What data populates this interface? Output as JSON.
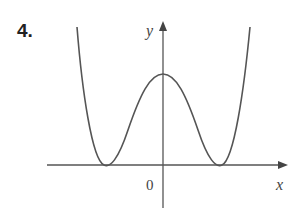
{
  "problem_number": "4.",
  "axes": {
    "x_label": "x",
    "y_label": "y",
    "origin_label": "0"
  },
  "curve": {
    "description": "even quartic-like curve with local maximum on y-axis and two minima touching x-axis",
    "color": "#555555"
  }
}
